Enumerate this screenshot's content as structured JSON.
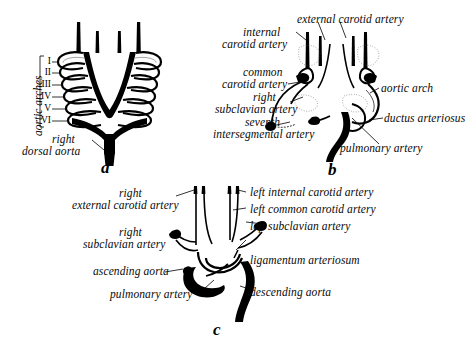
{
  "figure": {
    "background": "#ffffff",
    "ink": "#000000"
  },
  "panels": [
    {
      "id": "a",
      "letter": "a",
      "caption": "Embryonic pharyngeal aortic arch system",
      "labels": {
        "aortic_arches": "aortic arches",
        "right_dorsal_aorta_line1": "right",
        "right_dorsal_aorta_line2": "dorsal aorta"
      },
      "arch_numerals": [
        "I",
        "II",
        "III",
        "IV",
        "V",
        "VI"
      ]
    },
    {
      "id": "b",
      "letter": "b",
      "caption": "Remodeled arch system of the late embryo",
      "labels": {
        "internal_carotid_line1": "internal",
        "internal_carotid_line2": "carotid artery",
        "external_carotid": "external carotid artery",
        "common_carotid_line1": "common",
        "common_carotid_line2": "carotid artery",
        "right_subclavian_line1": "right",
        "right_subclavian_line2": "subclavian artery",
        "seventh_intersegmental_line1": "seventh",
        "seventh_intersegmental_line2": "intersegmental artery",
        "aortic_arch": "aortic arch",
        "ductus_arteriosus": "ductus arteriosus",
        "pulmonary_artery": "pulmonary artery"
      }
    },
    {
      "id": "c",
      "letter": "c",
      "caption": "Definitive adult arterial pattern",
      "labels": {
        "right_external_carotid_line1": "right",
        "right_external_carotid_line2": "external carotid artery",
        "right_subclavian_line1": "right",
        "right_subclavian_line2": "subclavian artery",
        "ascending_aorta": "ascending aorta",
        "pulmonary_artery": "pulmonary artery",
        "left_internal_carotid": "left internal carotid artery",
        "left_common_carotid": "left common carotid artery",
        "left_subclavian": "left subclavian artery",
        "ligamentum_arteriosum": "ligamentum arteriosum",
        "descending_aorta": "descending aorta"
      }
    }
  ]
}
